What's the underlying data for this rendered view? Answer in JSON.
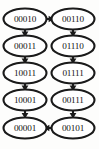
{
  "diagram": {
    "background_color": "#fdfdfc",
    "node_fill": "#ffffff",
    "node_stroke": "#1a1a1a",
    "edge_color": "#1a1a1a",
    "nodes": [
      {
        "id": "n0",
        "label": "00010",
        "column": "left",
        "row": 0,
        "cx": 25,
        "cy": 19
      },
      {
        "id": "n1",
        "label": "00011",
        "column": "left",
        "row": 1,
        "cx": 25,
        "cy": 46
      },
      {
        "id": "n2",
        "label": "10011",
        "column": "left",
        "row": 2,
        "cx": 25,
        "cy": 73
      },
      {
        "id": "n3",
        "label": "10001",
        "column": "left",
        "row": 3,
        "cx": 25,
        "cy": 100
      },
      {
        "id": "n4",
        "label": "00001",
        "column": "left",
        "row": 4,
        "cx": 25,
        "cy": 128
      },
      {
        "id": "n5",
        "label": "00110",
        "column": "right",
        "row": 0,
        "cx": 73,
        "cy": 19
      },
      {
        "id": "n6",
        "label": "01110",
        "column": "right",
        "row": 1,
        "cx": 73,
        "cy": 46
      },
      {
        "id": "n7",
        "label": "01111",
        "column": "right",
        "row": 2,
        "cx": 73,
        "cy": 73
      },
      {
        "id": "n8",
        "label": "00111",
        "column": "right",
        "row": 3,
        "cx": 73,
        "cy": 100
      },
      {
        "id": "n9",
        "label": "00101",
        "column": "right",
        "row": 4,
        "cx": 73,
        "cy": 128
      }
    ],
    "edges": [
      {
        "id": "e0",
        "from": "00010",
        "to": "00011",
        "direction": "down"
      },
      {
        "id": "e1",
        "from": "00011",
        "to": "10011",
        "direction": "down"
      },
      {
        "id": "e2",
        "from": "10011",
        "to": "10001",
        "direction": "down"
      },
      {
        "id": "e3",
        "from": "10001",
        "to": "00001",
        "direction": "down"
      },
      {
        "id": "e4",
        "from": "00010",
        "to": "00110",
        "direction": "right"
      },
      {
        "id": "e5",
        "from": "00110",
        "to": "01110",
        "direction": "down"
      },
      {
        "id": "e6",
        "from": "01110",
        "to": "01111",
        "direction": "down"
      },
      {
        "id": "e7",
        "from": "01111",
        "to": "00111",
        "direction": "down"
      },
      {
        "id": "e8",
        "from": "00111",
        "to": "00101",
        "direction": "down"
      },
      {
        "id": "e9",
        "from": "00101",
        "to": "00001",
        "direction": "left"
      }
    ]
  }
}
